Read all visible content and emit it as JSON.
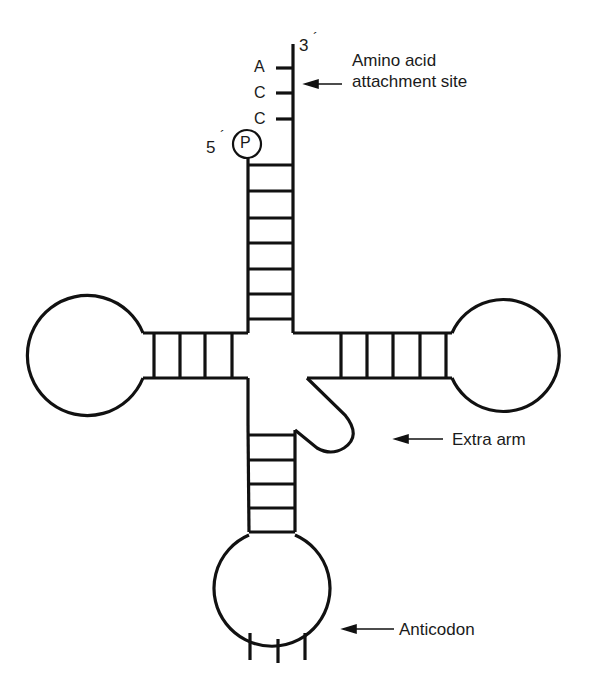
{
  "diagram": {
    "labels": {
      "amino_acid_site_line1": "Amino acid",
      "amino_acid_site_line2": "attachment site",
      "extra_arm": "Extra arm",
      "anticodon": "Anticodon"
    },
    "ends": {
      "three_prime": "3",
      "five_prime": "5",
      "prime_mark": "´",
      "phosphate": "P"
    },
    "acceptor_bases": [
      "A",
      "C",
      "C"
    ],
    "stems": {
      "acceptor_rungs": 7,
      "d_arm_rungs": 4,
      "t_arm_rungs": 5,
      "anticodon_rungs": 5
    },
    "colors": {
      "line": "#111111",
      "text": "#1a1a1a",
      "background": "#ffffff"
    }
  }
}
